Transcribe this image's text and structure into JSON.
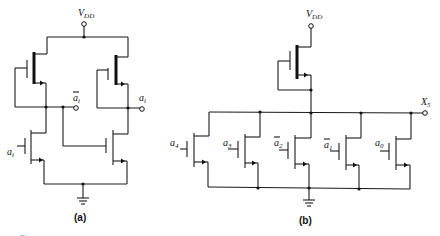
{
  "diagram": {
    "panel_a": {
      "caption": "(a)",
      "supply_label": "V",
      "supply_sub": "DD",
      "input_label": "a",
      "input_sub": "i",
      "output_bar_label": "a",
      "output_bar_sub": "i",
      "output_label": "a",
      "output_sub": "i"
    },
    "panel_b": {
      "caption": "(b)",
      "supply_label": "V",
      "supply_sub": "DD",
      "output_label": "X",
      "output_sub": "5",
      "inputs": [
        {
          "label": "a",
          "sub": "4",
          "bar": false
        },
        {
          "label": "a",
          "sub": "3",
          "bar": false
        },
        {
          "label": "a",
          "sub": "2",
          "bar": true
        },
        {
          "label": "a",
          "sub": "1",
          "bar": true
        },
        {
          "label": "a",
          "sub": "0",
          "bar": false
        }
      ]
    },
    "figure_caption_fragment": "Figure"
  }
}
